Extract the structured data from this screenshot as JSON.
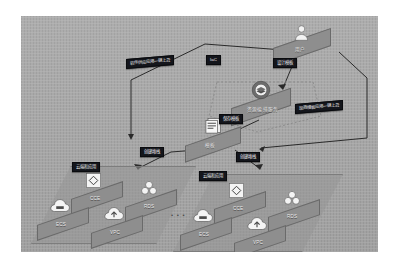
{
  "diagram": {
    "canvas_bg": "#a9a9a9",
    "tag_bg": "#14161c",
    "slab_color": "#8e8e8e",
    "nodes": {
      "user": {
        "label": "用户",
        "icon": "person-icon"
      },
      "orchestration": {
        "label": "资源编排服务",
        "icon": "gear-stack-icon"
      },
      "template": {
        "label": "模板",
        "icon": "document-icon"
      }
    },
    "tags": {
      "deploy_left": "软件供应应用一键上云",
      "iac": "IaC",
      "design_template": "设计模板",
      "save_template": "保存模板",
      "deploy_right": "现商模板应用一键上云",
      "create_stack_left": "创建堆栈",
      "create_stack_right": "创建堆栈",
      "cloud_app_left": "云端和应用",
      "cloud_app_right": "云端和应用"
    },
    "clusters": [
      {
        "name": "cluster-left",
        "services": [
          {
            "id": "cce",
            "label": "CCE",
            "icon": "diamond-square-icon"
          },
          {
            "id": "rds",
            "label": "RDS",
            "icon": "dots-cluster-icon"
          },
          {
            "id": "ecs",
            "label": "ECS",
            "icon": "cloud-server-icon"
          },
          {
            "id": "vpc",
            "label": "VPC",
            "icon": "cloud-network-icon"
          }
        ]
      },
      {
        "name": "cluster-right",
        "services": [
          {
            "id": "cce",
            "label": "CCE",
            "icon": "diamond-square-icon"
          },
          {
            "id": "rds",
            "label": "RDS",
            "icon": "dots-cluster-icon"
          },
          {
            "id": "ecs",
            "label": "ECS",
            "icon": "cloud-server-icon"
          },
          {
            "id": "vpc",
            "label": "VPC",
            "icon": "cloud-network-icon"
          }
        ]
      }
    ],
    "separator": "• • •"
  }
}
